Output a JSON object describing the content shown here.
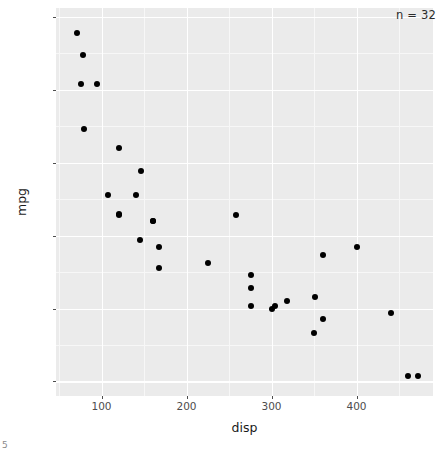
{
  "chart_data": {
    "type": "scatter",
    "title": "",
    "xlabel": "disp",
    "ylabel": "mpg",
    "annotation": "n = 32",
    "xlim": [
      46.5,
      490
    ],
    "ylim": [
      9.0,
      35.6
    ],
    "x_ticks": [
      100,
      200,
      300,
      400
    ],
    "y_ticks": [
      10,
      15,
      20,
      25,
      30,
      35
    ],
    "x_minor_ticks": [
      50,
      150,
      250,
      350,
      450
    ],
    "y_minor_ticks": [
      12.5,
      17.5,
      22.5,
      27.5,
      32.5
    ],
    "grid": true,
    "legend": "none",
    "point_color": "#000000",
    "panel_color": "#ebebeb",
    "grid_color": "#ffffff",
    "n": 32,
    "x": [
      160,
      160,
      108,
      258,
      360,
      225,
      360,
      146.7,
      140.8,
      167.6,
      167.6,
      275.8,
      275.8,
      275.8,
      472,
      460,
      440,
      78.7,
      75.7,
      71.1,
      120.1,
      318,
      304,
      350,
      400,
      79,
      120.3,
      95.1,
      351,
      145,
      301,
      121
    ],
    "y": [
      21,
      21,
      22.8,
      21.4,
      18.7,
      18.1,
      14.3,
      24.4,
      22.8,
      19.2,
      17.8,
      16.4,
      17.3,
      15.2,
      10.4,
      10.4,
      14.7,
      32.4,
      30.4,
      33.9,
      21.5,
      15.5,
      15.2,
      13.3,
      19.2,
      27.3,
      26,
      30.4,
      15.8,
      19.7,
      15,
      21.4
    ]
  },
  "axis": {
    "x_tick_labels": [
      "100",
      "200",
      "300",
      "400"
    ],
    "y_tick_labels": [
      "35",
      "30",
      "25",
      "20",
      "15",
      "10"
    ]
  },
  "corner": {
    "artifact": "5"
  }
}
